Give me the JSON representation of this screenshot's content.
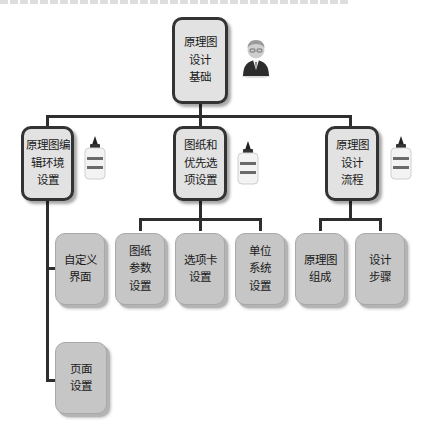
{
  "diagram": {
    "type": "hierarchy-tree",
    "root": {
      "lines": [
        "原理图",
        "设计",
        "基础"
      ],
      "icon": "businessman-icon"
    },
    "branches": [
      {
        "lines": [
          "原理图编",
          "辑环境",
          "设置"
        ],
        "icon": "glue-bottle-icon",
        "children": [
          {
            "lines": [
              "自定义",
              "界面"
            ]
          },
          {
            "lines": [
              "页面",
              "设置"
            ]
          }
        ]
      },
      {
        "lines": [
          "图纸和",
          "优先选",
          "项设置"
        ],
        "icon": "glue-bottle-icon",
        "children": [
          {
            "lines": [
              "图纸",
              "参数",
              "设置"
            ]
          },
          {
            "lines": [
              "选项卡",
              "设置"
            ]
          },
          {
            "lines": [
              "单位",
              "系统",
              "设置"
            ]
          }
        ]
      },
      {
        "lines": [
          "原理图",
          "设计",
          "流程"
        ],
        "icon": "glue-bottle-icon",
        "children": [
          {
            "lines": [
              "原理图",
              "组成"
            ]
          },
          {
            "lines": [
              "设计",
              "步骤"
            ]
          }
        ]
      }
    ]
  },
  "colors": {
    "main_fill": "#e2e2e2",
    "main_border": "#333333",
    "sub_fill": "#c6c6c6",
    "connector": "#2e2e2e"
  }
}
